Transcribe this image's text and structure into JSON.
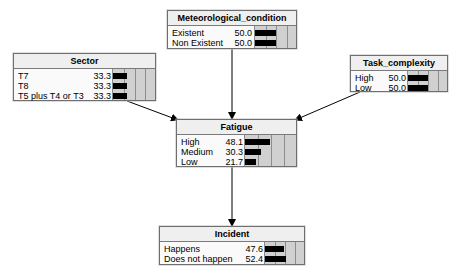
{
  "diagram": {
    "type": "bayesian-network",
    "nodes": [
      {
        "id": "meteorological_condition",
        "title": "Meteorological_condition",
        "box": {
          "x": 167,
          "y": 10,
          "w": 130,
          "h": 39
        },
        "value_right": 84,
        "bar_left": 86,
        "states": [
          {
            "label": "Existent",
            "value": "50.0",
            "pct": 50.0
          },
          {
            "label": "Non Existent",
            "value": "50.0",
            "pct": 50.0
          }
        ]
      },
      {
        "id": "sector",
        "title": "Sector",
        "box": {
          "x": 13,
          "y": 53,
          "w": 143,
          "h": 48
        },
        "value_right": 97,
        "bar_left": 98,
        "states": [
          {
            "label": "T7",
            "value": "33.3",
            "pct": 33.3
          },
          {
            "label": "T8",
            "value": "33.3",
            "pct": 33.3
          },
          {
            "label": "T5 plus T4 or T3",
            "value": "33.3",
            "pct": 33.3
          }
        ]
      },
      {
        "id": "task_complexity",
        "title": "Task_complexity",
        "box": {
          "x": 350,
          "y": 55,
          "w": 98,
          "h": 37
        },
        "value_right": 55,
        "bar_left": 56,
        "states": [
          {
            "label": "High",
            "value": "50.0",
            "pct": 50.0
          },
          {
            "label": "Low",
            "value": "50.0",
            "pct": 50.0
          }
        ]
      },
      {
        "id": "fatigue",
        "title": "Fatigue",
        "box": {
          "x": 176,
          "y": 119,
          "w": 121,
          "h": 48
        },
        "value_right": 66,
        "bar_left": 67,
        "states": [
          {
            "label": "High",
            "value": "48.1",
            "pct": 48.1
          },
          {
            "label": "Medium",
            "value": "30.3",
            "pct": 30.3
          },
          {
            "label": "Low",
            "value": "21.7",
            "pct": 21.7
          }
        ]
      },
      {
        "id": "incident",
        "title": "Incident",
        "box": {
          "x": 159,
          "y": 226,
          "w": 146,
          "h": 39
        },
        "value_right": 103,
        "bar_left": 104,
        "states": [
          {
            "label": "Happens",
            "value": "47.6",
            "pct": 47.6
          },
          {
            "label": "Does not happen",
            "value": "52.4",
            "pct": 52.4
          }
        ]
      }
    ],
    "edges": [
      {
        "from": "meteorological_condition",
        "to": "fatigue",
        "x1": 232,
        "y1": 49,
        "x2": 232,
        "y2": 119
      },
      {
        "from": "sector",
        "to": "fatigue",
        "x1": 127,
        "y1": 101,
        "x2": 178,
        "y2": 120
      },
      {
        "from": "task_complexity",
        "to": "fatigue",
        "x1": 360,
        "y1": 92,
        "x2": 295,
        "y2": 120
      },
      {
        "from": "fatigue",
        "to": "incident",
        "x1": 232,
        "y1": 167,
        "x2": 232,
        "y2": 226
      }
    ],
    "bar_scale_note": "bar full width represents 100%",
    "colors": {
      "bar": "#000000",
      "bar_area_gray": "#d0d0d0",
      "grid_line": "#8d8d8d",
      "header_bg": "#efefef",
      "border": "#6f6f6f",
      "edge": "#000000"
    }
  }
}
